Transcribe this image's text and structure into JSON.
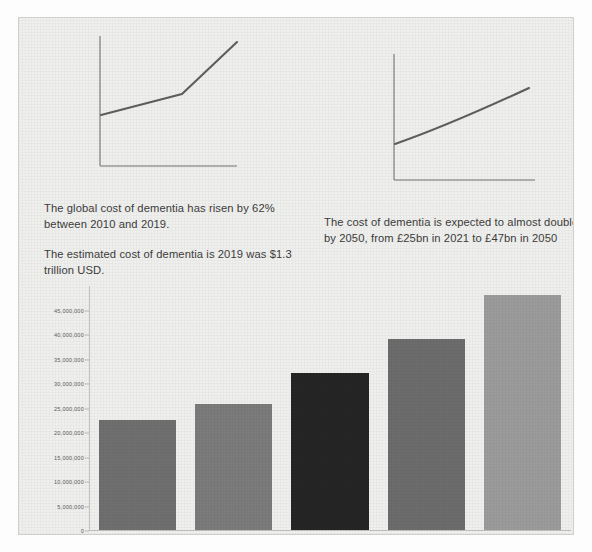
{
  "page": {
    "background_color": "#efefed",
    "frame_border_color": "#cfcfcb"
  },
  "line_charts": [
    {
      "name": "dementia-cost-rise-2010-2019",
      "axis_color": "#9a9a96",
      "line_color": "#5e5e5c",
      "points": [
        [
          0.04,
          0.42
        ],
        [
          0.52,
          0.58
        ],
        [
          0.95,
          0.95
        ]
      ]
    },
    {
      "name": "dementia-cost-projection-2050",
      "axis_color": "#9a9a96",
      "line_color": "#5e5e5c",
      "points": [
        [
          0.03,
          0.35
        ],
        [
          0.3,
          0.5
        ],
        [
          0.95,
          0.82
        ]
      ]
    }
  ],
  "text_left": {
    "paragraph_1": "The global cost of dementia has risen by 62% between 2010 and 2019.",
    "paragraph_2": "The estimated cost of dementia is 2019 was $1.3 trillion USD."
  },
  "text_right": {
    "paragraph_1": "The cost of dementia is expected to almost double by 2050, from £25bn in 2021 to £47bn in 2050"
  },
  "chart_data": {
    "type": "bar",
    "title": "",
    "xlabel": "",
    "ylabel": "",
    "categories": [
      "2018",
      "2021",
      "2030",
      "2040",
      "2050"
    ],
    "values": [
      22400000,
      25800000,
      32000000,
      39000000,
      48000000
    ],
    "bar_colors": [
      "#6f6f6f",
      "#7b7b7b",
      "#252525",
      "#6c6c6c",
      "#9b9b9b"
    ],
    "ylim": [
      0,
      50000000
    ],
    "yticks": [
      0,
      5000000,
      10000000,
      15000000,
      20000000,
      25000000,
      30000000,
      35000000,
      40000000,
      45000000
    ],
    "ytick_labels": [
      "0",
      "5,000,000",
      "10,000,000",
      "15,000,000",
      "20,000,000",
      "25,000,000",
      "30,000,000",
      "35,000,000",
      "40,000,000",
      "45,000,000"
    ],
    "grid": false,
    "legend": "none",
    "axis_color": "#c2c2be",
    "tick_text_color": "#5d5d5d"
  }
}
